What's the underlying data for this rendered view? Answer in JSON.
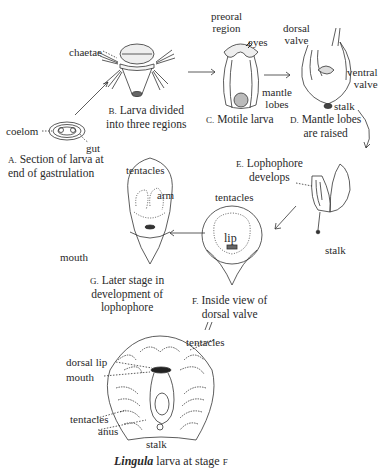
{
  "stages": [
    {
      "letter": "A.",
      "caption_line1": "Section of larva at",
      "caption_line2": "end of gastrulation",
      "labels": [
        "coelom",
        "gut"
      ]
    },
    {
      "letter": "B.",
      "caption_line1": "Larva divided",
      "caption_line2": "into three regions",
      "labels": [
        "chaetae"
      ]
    },
    {
      "letter": "C.",
      "caption_line1": "Motile larva",
      "caption_line2": "",
      "labels": [
        "preoral region",
        "eyes",
        "mantle lobes"
      ]
    },
    {
      "letter": "D.",
      "caption_line1": "Mantle lobes",
      "caption_line2": "are raised",
      "labels": [
        "dorsal valve",
        "ventral valve",
        "stalk"
      ]
    },
    {
      "letter": "E.",
      "caption_line1": "Lophophore",
      "caption_line2": "develops",
      "labels": [
        "stalk"
      ]
    },
    {
      "letter": "F.",
      "caption_line1": "Inside view of",
      "caption_line2": "dorsal valve",
      "labels": [
        "tentacles",
        "lip"
      ]
    },
    {
      "letter": "G.",
      "caption_line1": "Later stage in",
      "caption_line2": "development of",
      "caption_line3": "lophophore",
      "labels": [
        "tentacles",
        "arm",
        "mouth"
      ]
    }
  ],
  "labels": {
    "coelom": "coelom",
    "gut": "gut",
    "chaetae": "chaetae",
    "preoral_1": "preoral",
    "preoral_2": "region",
    "eyes": "eyes",
    "mantle_1": "mantle",
    "mantle_2": "lobes",
    "dorsal_valve_1": "dorsal",
    "dorsal_valve_2": "valve",
    "ventral_valve_1": "ventral",
    "ventral_valve_2": "valve",
    "stalk_d": "stalk",
    "stalk_e": "stalk",
    "tentacles_f": "tentacles",
    "lip_f": "lip",
    "tentacles_g": "tentacles",
    "arm_g": "arm",
    "mouth_g": "mouth",
    "bottom_tentacles_top": "tentacles",
    "dorsal_lip": "dorsal lip",
    "mouth_bottom": "mouth",
    "tentacles_bottom": "tentacles",
    "anus": "anus",
    "stalk_bottom": "stalk"
  },
  "title": {
    "genus": "Lingula",
    "rest": " larva at stage ",
    "stage": "F"
  }
}
